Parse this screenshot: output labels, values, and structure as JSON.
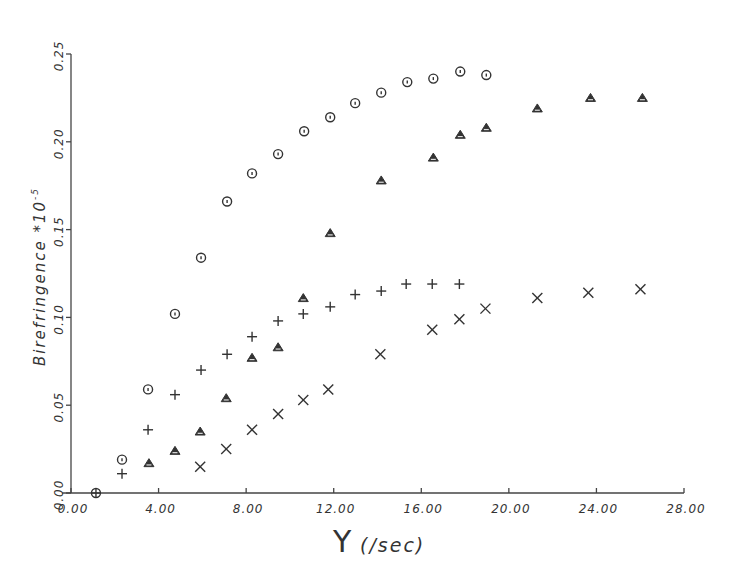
{
  "chart_data": {
    "type": "scatter",
    "title": "",
    "xlabel": "γ̇ (/sec)",
    "xlabel_symbol": "Υ",
    "xlabel_unit": "(/sec)",
    "ylabel": "Birefringence *10",
    "ylabel_exponent": "-5",
    "xlim": [
      0,
      28
    ],
    "ylim": [
      0,
      0.25
    ],
    "x_ticks": [
      0,
      4,
      8,
      12,
      16,
      20,
      24,
      28
    ],
    "x_tick_labels": [
      "0.00",
      "4.00",
      "8.00",
      "12.00",
      "16.00",
      "20.00",
      "24.00",
      "28.00"
    ],
    "y_ticks": [
      0,
      0.05,
      0.1,
      0.15,
      0.2,
      0.25
    ],
    "y_tick_labels": [
      "0.00",
      "0.05",
      "0.10",
      "0.15",
      "0.20",
      "0.25"
    ],
    "grid": false,
    "legend": null,
    "origin_point": {
      "x": 1.14,
      "y": 0.0,
      "marker": "circle-plus"
    },
    "series": [
      {
        "name": "circle",
        "marker": "circle",
        "x": [
          2.33,
          3.52,
          4.75,
          5.94,
          7.13,
          8.27,
          9.46,
          10.65,
          11.84,
          12.98,
          14.17,
          15.36,
          16.55,
          17.78,
          18.97
        ],
        "y": [
          0.019,
          0.059,
          0.102,
          0.134,
          0.166,
          0.182,
          0.193,
          0.206,
          0.214,
          0.222,
          0.228,
          0.234,
          0.236,
          0.24,
          0.238
        ]
      },
      {
        "name": "plus",
        "marker": "plus",
        "x": [
          2.33,
          3.52,
          4.75,
          5.94,
          7.13,
          8.27,
          9.46,
          10.61,
          11.84,
          12.98,
          14.17,
          15.31,
          16.5,
          17.74
        ],
        "y": [
          0.011,
          0.036,
          0.056,
          0.07,
          0.079,
          0.089,
          0.098,
          0.102,
          0.106,
          0.113,
          0.115,
          0.119,
          0.119,
          0.119
        ]
      },
      {
        "name": "triangle",
        "marker": "triangle",
        "x": [
          3.56,
          4.75,
          5.9,
          7.09,
          8.27,
          9.46,
          10.61,
          11.84,
          14.17,
          16.55,
          17.78,
          18.97,
          21.3,
          23.73,
          26.1
        ],
        "y": [
          0.017,
          0.024,
          0.035,
          0.054,
          0.077,
          0.083,
          0.111,
          0.148,
          0.178,
          0.191,
          0.204,
          0.208,
          0.219,
          0.225,
          0.225
        ]
      },
      {
        "name": "cross",
        "marker": "x",
        "x": [
          5.9,
          7.09,
          8.27,
          9.46,
          10.61,
          11.75,
          14.13,
          16.5,
          17.74,
          18.93,
          21.3,
          23.63,
          26.01
        ],
        "y": [
          0.015,
          0.025,
          0.036,
          0.045,
          0.053,
          0.059,
          0.079,
          0.093,
          0.099,
          0.105,
          0.111,
          0.114,
          0.116
        ]
      }
    ]
  }
}
